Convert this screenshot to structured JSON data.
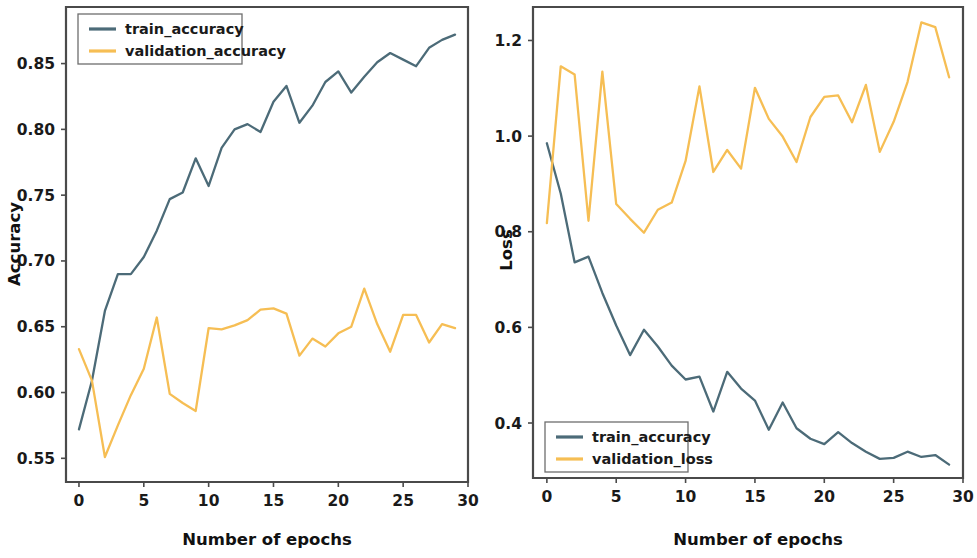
{
  "figure": {
    "background": "#ffffff",
    "colors": {
      "train": "#4c6b78",
      "validation": "#f6be54",
      "axis": "#4a4a4a",
      "text": "#1a1a1a"
    }
  },
  "panels": [
    {
      "name": "accuracy-panel",
      "xlabel": "Number of epochs",
      "ylabel": "Accuracy",
      "xticks": [
        "0",
        "5",
        "10",
        "15",
        "20",
        "25",
        "30"
      ],
      "yticks": [
        "0.55",
        "0.60",
        "0.65",
        "0.70",
        "0.75",
        "0.80",
        "0.85"
      ],
      "legend": [
        {
          "label": "train_accuracy",
          "color": "#4c6b78"
        },
        {
          "label": "validation_accuracy",
          "color": "#f6be54"
        }
      ]
    },
    {
      "name": "loss-panel",
      "xlabel": "Number of epochs",
      "ylabel": "Loss",
      "xticks": [
        "0",
        "5",
        "10",
        "15",
        "20",
        "25",
        "30"
      ],
      "yticks": [
        "0.4",
        "0.6",
        "0.8",
        "1.0",
        "1.2"
      ],
      "legend": [
        {
          "label": "train_accuracy",
          "color": "#4c6b78"
        },
        {
          "label": "validation_loss",
          "color": "#f6be54"
        }
      ]
    }
  ],
  "chart_data": [
    {
      "type": "line",
      "title": "",
      "xlabel": "Number of epochs",
      "ylabel": "Accuracy",
      "xlim": [
        -1,
        30
      ],
      "ylim": [
        0.532,
        0.893
      ],
      "xticks": [
        0,
        5,
        10,
        15,
        20,
        25,
        30
      ],
      "yticks": [
        0.55,
        0.6,
        0.65,
        0.7,
        0.75,
        0.8,
        0.85
      ],
      "grid": false,
      "legend_position": "upper left",
      "x": [
        0,
        1,
        2,
        3,
        4,
        5,
        6,
        7,
        8,
        9,
        10,
        11,
        12,
        13,
        14,
        15,
        16,
        17,
        18,
        19,
        20,
        21,
        22,
        23,
        24,
        25,
        26,
        27,
        28,
        29
      ],
      "series": [
        {
          "name": "train_accuracy",
          "color": "#4c6b78",
          "values": [
            0.572,
            0.609,
            0.662,
            0.69,
            0.69,
            0.703,
            0.723,
            0.747,
            0.752,
            0.778,
            0.757,
            0.786,
            0.8,
            0.804,
            0.798,
            0.821,
            0.833,
            0.805,
            0.818,
            0.836,
            0.844,
            0.828,
            0.84,
            0.851,
            0.858,
            0.853,
            0.848,
            0.862,
            0.868,
            0.872
          ]
        },
        {
          "name": "validation_accuracy",
          "color": "#f6be54",
          "values": [
            0.633,
            0.609,
            0.551,
            0.575,
            0.598,
            0.618,
            0.657,
            0.599,
            0.592,
            0.586,
            0.649,
            0.648,
            0.651,
            0.655,
            0.663,
            0.664,
            0.66,
            0.628,
            0.641,
            0.635,
            0.645,
            0.65,
            0.679,
            0.652,
            0.631,
            0.659,
            0.659,
            0.638,
            0.652,
            0.649
          ]
        }
      ]
    },
    {
      "type": "line",
      "title": "",
      "xlabel": "Number of epochs",
      "ylabel": "Loss",
      "xlim": [
        -1,
        30
      ],
      "ylim": [
        0.285,
        1.27
      ],
      "xticks": [
        0,
        5,
        10,
        15,
        20,
        25,
        30
      ],
      "yticks": [
        0.4,
        0.6,
        0.8,
        1.0,
        1.2
      ],
      "grid": false,
      "legend_position": "lower left",
      "x": [
        0,
        1,
        2,
        3,
        4,
        5,
        6,
        7,
        8,
        9,
        10,
        11,
        12,
        13,
        14,
        15,
        16,
        17,
        18,
        19,
        20,
        21,
        22,
        23,
        24,
        25,
        26,
        27,
        28,
        29
      ],
      "series": [
        {
          "name": "train_accuracy",
          "color": "#4c6b78",
          "values": [
            0.985,
            0.88,
            0.736,
            0.748,
            0.672,
            0.604,
            0.542,
            0.595,
            0.56,
            0.52,
            0.491,
            0.497,
            0.424,
            0.507,
            0.472,
            0.447,
            0.386,
            0.443,
            0.389,
            0.367,
            0.356,
            0.381,
            0.358,
            0.34,
            0.325,
            0.327,
            0.34,
            0.329,
            0.333,
            0.313,
            0.318
          ]
        },
        {
          "name": "validation_loss",
          "color": "#f6be54",
          "values": [
            0.818,
            1.146,
            1.129,
            0.823,
            1.135,
            0.858,
            0.827,
            0.798,
            0.846,
            0.861,
            0.948,
            1.104,
            0.925,
            0.971,
            0.932,
            1.101,
            1.036,
            0.999,
            0.946,
            1.04,
            1.082,
            1.085,
            1.029,
            1.107,
            0.967,
            1.03,
            1.113,
            1.238,
            1.228,
            1.123
          ]
        }
      ]
    }
  ]
}
